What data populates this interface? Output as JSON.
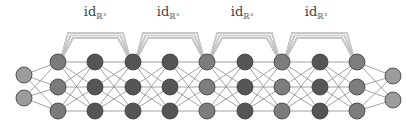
{
  "diagram": {
    "skip_labels": [
      {
        "main": "id",
        "sub": "ℝ³"
      },
      {
        "main": "id",
        "sub": "ℝ³"
      },
      {
        "main": "id",
        "sub": "ℝ³"
      },
      {
        "main": "id",
        "sub": "ℝ³"
      }
    ],
    "layers": [
      {
        "x": 24,
        "ys": [
          75,
          98
        ],
        "color": "#9c9c9c",
        "role": "input"
      },
      {
        "x": 58,
        "ys": [
          62,
          87,
          111
        ],
        "color": "#7a7a7a",
        "role": "hidden"
      },
      {
        "x": 95,
        "ys": [
          62,
          87,
          111
        ],
        "color": "#555555",
        "role": "hidden"
      },
      {
        "x": 133,
        "ys": [
          62,
          87,
          111
        ],
        "color": "#555555",
        "role": "hidden"
      },
      {
        "x": 170,
        "ys": [
          62,
          87,
          111
        ],
        "color": "#555555",
        "role": "hidden"
      },
      {
        "x": 207,
        "ys": [
          62,
          87,
          111
        ],
        "color": "#7d7d7d",
        "role": "hidden"
      },
      {
        "x": 245,
        "ys": [
          62,
          87,
          111
        ],
        "color": "#555555",
        "role": "hidden"
      },
      {
        "x": 282,
        "ys": [
          62,
          87,
          111
        ],
        "color": "#7d7d7d",
        "role": "hidden"
      },
      {
        "x": 320,
        "ys": [
          62,
          87,
          111
        ],
        "color": "#555555",
        "role": "hidden"
      },
      {
        "x": 357,
        "ys": [
          62,
          87,
          111
        ],
        "color": "#7d7d7d",
        "role": "hidden"
      },
      {
        "x": 393,
        "ys": [
          76,
          100
        ],
        "color": "#9c9c9c",
        "role": "output"
      }
    ],
    "skips": [
      {
        "from": 58,
        "to": 133,
        "label_x": 95
      },
      {
        "from": 133,
        "to": 207,
        "label_x": 168
      },
      {
        "from": 207,
        "to": 282,
        "label_x": 242
      },
      {
        "from": 282,
        "to": 357,
        "label_x": 316
      }
    ],
    "colors": {
      "edge": "#8a8a8a",
      "skip": "#9a9a9a",
      "node_stroke": "#3a3a3a"
    }
  }
}
